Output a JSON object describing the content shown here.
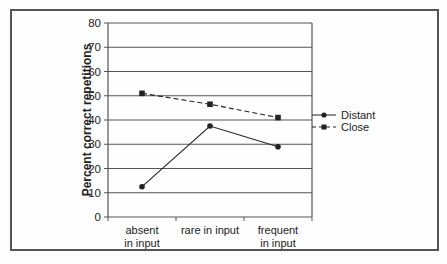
{
  "chart_data": {
    "type": "line",
    "title": "",
    "xlabel": "",
    "ylabel": "Percent correct repetitions",
    "ylim": [
      0,
      80
    ],
    "yticks": [
      0,
      10,
      20,
      30,
      40,
      50,
      60,
      70,
      80
    ],
    "grid": true,
    "legend_position": "right",
    "categories": [
      "absent in input",
      "rare in input",
      "frequent in input"
    ],
    "category_lines": [
      [
        "absent",
        "in input"
      ],
      [
        "rare in input"
      ],
      [
        "frequent",
        "in input"
      ]
    ],
    "series": [
      {
        "name": "Distant",
        "style": "solid",
        "marker": "circle",
        "values": [
          12.5,
          37.5,
          29
        ]
      },
      {
        "name": "Close",
        "style": "dashed",
        "marker": "square",
        "values": [
          51,
          46.5,
          41
        ]
      }
    ]
  },
  "colors": {
    "line": "#222222",
    "grid": "#555555",
    "frame": "#555555"
  }
}
